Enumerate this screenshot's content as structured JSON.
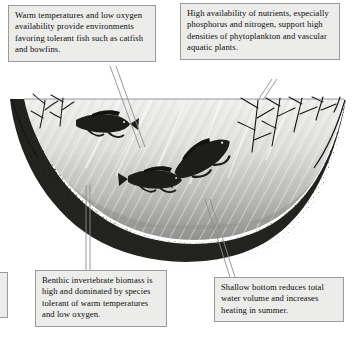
{
  "callouts": [
    {
      "id": "warm-low-oxygen",
      "position": "top-left",
      "text": "Warm temperatures and low oxygen availability provide environments favoring tolerant fish such as catfish and bowfins."
    },
    {
      "id": "nutrient-availability",
      "position": "top-right",
      "text": "High availability of nutrients, especially phosphorus and nitrogen, support high densities of phytoplankton and vascular aquatic plants."
    },
    {
      "id": "benthic-invertebrates",
      "position": "bottom-left",
      "text": "Benthic invertebrate biomass is high and dominated by species tolerant of warm temperatures and low oxygen."
    },
    {
      "id": "shallow-bottom",
      "position": "bottom-right",
      "text": "Shallow bottom reduces total water volume and increases heating in summer."
    }
  ],
  "illustration": {
    "scene": "lake-basin-cross-section",
    "water_label": "water-body",
    "sediment_label": "sediment-bed",
    "fish": [
      {
        "name": "fish-upper-left",
        "species_hint": "catfish"
      },
      {
        "name": "fish-lower-left",
        "species_hint": "catfish"
      },
      {
        "name": "fish-center",
        "species_hint": "bowfin"
      }
    ],
    "vegetation": [
      {
        "name": "aquatic-plant-left"
      },
      {
        "name": "aquatic-plant-right-cluster"
      }
    ]
  },
  "colors": {
    "box_fill": "#ececeb",
    "box_border": "#9a9a9a",
    "water_light": "#e3e3e2",
    "water_deep": "#9a9a99",
    "sediment_dark": "#2b2b29",
    "leader_line": "#8a8a8a",
    "text": "#0d0d0d"
  }
}
